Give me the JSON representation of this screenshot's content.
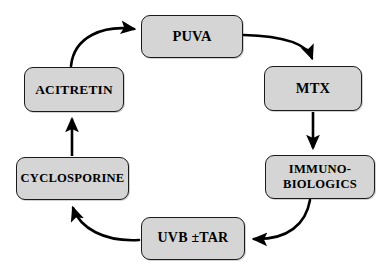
{
  "diagram": {
    "type": "cycle-flowchart",
    "direction": "clockwise",
    "background_color": "#ffffff",
    "node_fill_color": "#d5d5d5",
    "node_border_color": "#1a1a1a",
    "arrow_color": "#000000",
    "nodes": [
      {
        "id": "puva",
        "label": "PUVA",
        "position": "top"
      },
      {
        "id": "mtx",
        "label": "MTX",
        "position": "top-right"
      },
      {
        "id": "immuno",
        "label": "IMMUNO-\nBIOLOGICS",
        "position": "bottom-right"
      },
      {
        "id": "uvb",
        "label": "UVB ±TAR",
        "position": "bottom"
      },
      {
        "id": "cyclo",
        "label": "CYCLOSPORINE",
        "position": "bottom-left"
      },
      {
        "id": "acitretin",
        "label": "ACITRETIN",
        "position": "top-left"
      }
    ],
    "edges": [
      {
        "from": "puva",
        "to": "mtx",
        "style": "curved",
        "arrowhead": "to"
      },
      {
        "from": "mtx",
        "to": "immuno",
        "style": "straight",
        "arrowhead": "to"
      },
      {
        "from": "immuno",
        "to": "uvb",
        "style": "curved",
        "arrowhead": "to"
      },
      {
        "from": "uvb",
        "to": "cyclo",
        "style": "curved",
        "arrowhead": "to"
      },
      {
        "from": "cyclo",
        "to": "acitretin",
        "style": "straight",
        "arrowhead": "to"
      },
      {
        "from": "acitretin",
        "to": "puva",
        "style": "curved",
        "arrowhead": "to"
      }
    ]
  }
}
